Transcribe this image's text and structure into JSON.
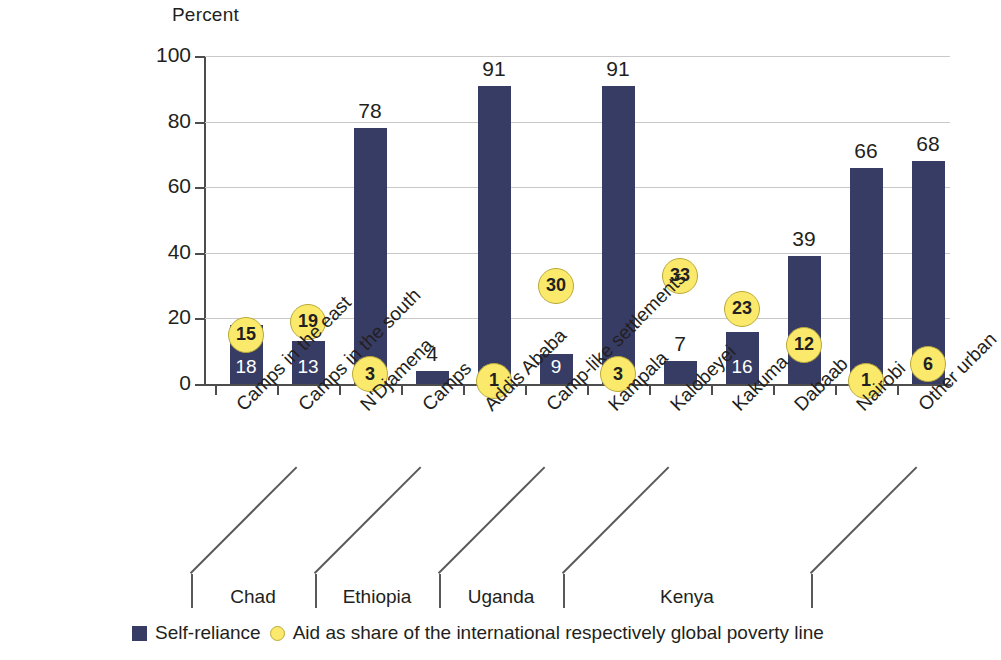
{
  "chart_data": {
    "type": "bar",
    "title": "",
    "ylabel": "Percent",
    "xlabel": "",
    "ylim": [
      0,
      100
    ],
    "yticks": [
      0,
      20,
      40,
      60,
      80,
      100
    ],
    "grid": true,
    "legend_position": "bottom",
    "categories": [
      "Camps in the east",
      "Camps in the south",
      "N'Djamena",
      "Camps",
      "Addis Ababa",
      "Camp-like settlements",
      "Kampala",
      "Kalobeyei",
      "Kakuma",
      "Dabaab",
      "Nairobi",
      "Other urban"
    ],
    "series": [
      {
        "name": "Self-reliance",
        "type": "bar",
        "color": "#373c64",
        "values": [
          18,
          13,
          78,
          4,
          91,
          9,
          91,
          7,
          16,
          39,
          66,
          68
        ]
      },
      {
        "name": "Aid as share of the international respectively global poverty line",
        "type": "scatter",
        "color": "#fae96b",
        "values": [
          15,
          19,
          3,
          null,
          1,
          30,
          3,
          33,
          23,
          12,
          1,
          6
        ]
      }
    ],
    "groups": [
      {
        "label": "Chad",
        "start": 0,
        "end": 2
      },
      {
        "label": "Ethiopia",
        "start": 2,
        "end": 4
      },
      {
        "label": "Uganda",
        "start": 4,
        "end": 6
      },
      {
        "label": "Kenya",
        "start": 6,
        "end": 10
      },
      {
        "label": "",
        "start": 10,
        "end": 12
      }
    ]
  },
  "legend": {
    "items": [
      {
        "marker": "square",
        "label": "Self-reliance"
      },
      {
        "marker": "circle",
        "label": "Aid as share of the international respectively global poverty line"
      }
    ]
  },
  "colors": {
    "bar": "#373c64",
    "dot_fill": "#fae96b",
    "dot_stroke": "#b9a93a",
    "grid": "#c9c9c9",
    "axis": "#4d4d4d",
    "text": "#231f20"
  }
}
